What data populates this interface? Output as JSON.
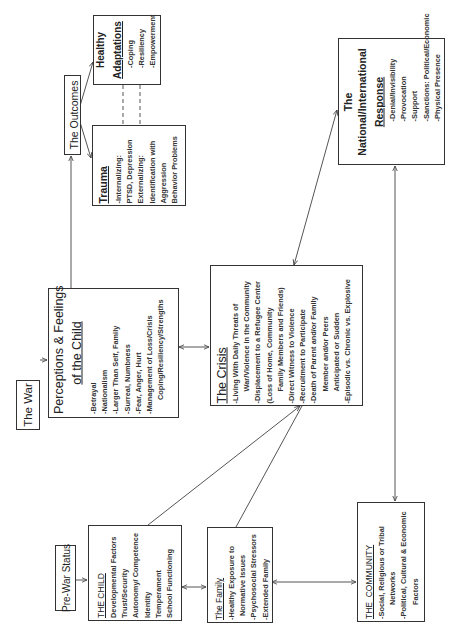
{
  "diagram": {
    "orientation": "rotated 90 degrees counter-clockwise",
    "nodes": {
      "the_war": {
        "title": "The War"
      },
      "perceptions": {
        "title_line1": "Perceptions & Feelings",
        "title_line2": "of the Child",
        "items": [
          "-Betrayal",
          "-Nationalism",
          "-Larger Than Self, Family",
          "-Surreal, Numbness",
          "-Fear, Anger, Hurt",
          "-Management of Loss/Crisis",
          "Coping/Resiliency/Strengths"
        ]
      },
      "outcomes": {
        "title": "The Outcomes"
      },
      "healthy_adaptations": {
        "title_line1": "Healthy",
        "title_line2": "Adaptations",
        "items": [
          "-Coping",
          "-Resiliency",
          "-Empowerment"
        ]
      },
      "trauma": {
        "title": "Trauma",
        "items": [
          "-Internalizing:",
          "PTSD, Depression",
          "Externalizing:",
          "Identification with",
          "Aggression",
          "Behavior Problems"
        ]
      },
      "crisis": {
        "title": "The Crisis",
        "items": [
          "-Living With Daily Threats of",
          "War/Violence in the Community",
          "-Displacement to a Refugee Center",
          "(Loss of Home, Community",
          "Family Members and Friends)",
          "-Direct Witness to Violence",
          "-Recruitment to Participate",
          "-Death of Parent and/or Family",
          "Member and/or Peers",
          "Anticipated or Sudden",
          "-Episodic vs. Chronic vs. Explosive"
        ]
      },
      "national_response": {
        "title_line1": "The",
        "title_line2": "National/International",
        "title_line3": "Response",
        "items": [
          "-Denial/Invisibility",
          "-Provocation",
          "-Support",
          "-Sanctions: Political/Economic",
          "-Physical Presence"
        ]
      },
      "pre_war_status": {
        "title": "Pre-War Status"
      },
      "the_child": {
        "title": "THE CHILD",
        "items": [
          "Developmental  Factors",
          "Trust/Security",
          "Autonomy/ Competence",
          "Identity",
          "Temperament",
          "School Functioning"
        ]
      },
      "the_family": {
        "title": "The Family",
        "items": [
          "-Healthy Exposure to",
          "Normative Issues",
          "-Psychosocial Stressors",
          "-Extended Family"
        ]
      },
      "the_community": {
        "title": "THE  COMMUNITY",
        "items": [
          "-Social, Religious or Tribal",
          "Networks",
          "-Political, Cultural & Economic",
          "Factors"
        ]
      }
    },
    "edges": [
      {
        "from": "the_war",
        "to": "perceptions",
        "type": "arrow"
      },
      {
        "from": "perceptions",
        "to": "outcomes",
        "type": "line"
      },
      {
        "from": "outcomes",
        "to": "healthy_adaptations",
        "type": "arrow"
      },
      {
        "from": "outcomes",
        "to": "trauma",
        "type": "arrow"
      },
      {
        "from": "trauma",
        "to": "healthy_adaptations",
        "type": "dashed"
      },
      {
        "from": "perceptions",
        "to": "crisis",
        "type": "bidirectional"
      },
      {
        "from": "crisis",
        "to": "national_response",
        "type": "bidirectional"
      },
      {
        "from": "national_response",
        "to": "the_community",
        "type": "bidirectional"
      },
      {
        "from": "pre_war_status",
        "to": "the_child",
        "type": "arrow"
      },
      {
        "from": "the_child",
        "to": "the_family",
        "type": "bidirectional"
      },
      {
        "from": "the_family",
        "to": "the_community",
        "type": "bidirectional"
      },
      {
        "from": "the_child",
        "to": "crisis",
        "type": "arrow"
      },
      {
        "from": "the_family",
        "to": "crisis",
        "type": "arrow"
      }
    ]
  }
}
